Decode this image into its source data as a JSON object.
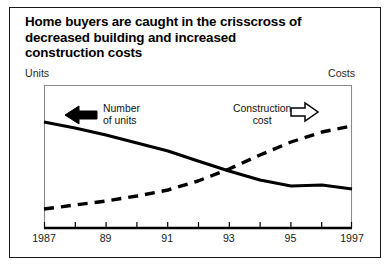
{
  "figure": {
    "title_lines": [
      "Home buyers are caught in the crisscross of",
      "decreased building and increased",
      "construction costs"
    ],
    "left_axis_caption": "Units",
    "right_axis_caption": "Costs"
  },
  "annotations": {
    "units": {
      "line1": "Number",
      "line2": "of units",
      "arrow": "left-arrow-filled-icon"
    },
    "costs": {
      "line1": "Construction",
      "line2": "cost",
      "arrow": "right-arrow-outline-icon"
    }
  },
  "chart_data": {
    "type": "line",
    "title": "Home buyers are caught in the crisscross of decreased building and increased construction costs",
    "xlabel": "",
    "ylabel": "",
    "ylabel_left": "Units",
    "ylabel_right": "Costs",
    "grid": false,
    "legend": "annotations-inline",
    "x": [
      1987,
      1988,
      1989,
      1990,
      1991,
      1992,
      1993,
      1994,
      1995,
      1996,
      1997
    ],
    "xticks": [
      1987,
      1988,
      1989,
      1990,
      1991,
      1992,
      1993,
      1994,
      1995,
      1996,
      1997
    ],
    "xticklabels": [
      "1987",
      "",
      "89",
      "",
      "91",
      "",
      "93",
      "",
      "95",
      "",
      "1997"
    ],
    "xlim": [
      1987,
      1997
    ],
    "series": [
      {
        "name": "Number of units",
        "style": "solid",
        "axis": "left",
        "color": "#000000",
        "values": [
          74,
          70,
          66,
          61,
          56,
          50,
          44,
          38,
          33,
          33,
          30
        ]
      },
      {
        "name": "Construction cost",
        "style": "dashed",
        "axis": "right",
        "color": "#000000",
        "values": [
          14,
          17,
          20,
          23,
          27,
          32,
          39,
          48,
          58,
          66,
          71
        ]
      }
    ],
    "crossover_year": 1993,
    "ylim": [
      0,
      100
    ]
  }
}
